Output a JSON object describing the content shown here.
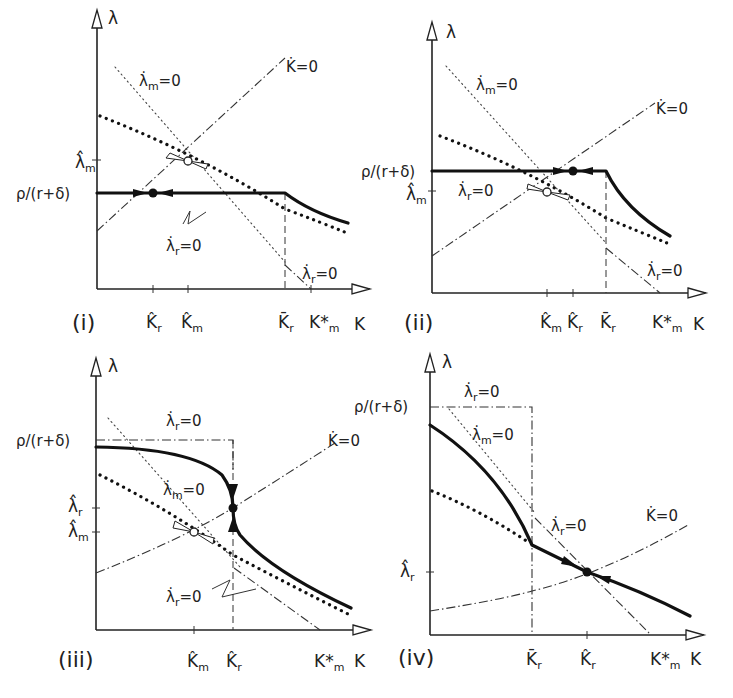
{
  "figure": {
    "panels": [
      {
        "id": "i",
        "label": "(i)",
        "y_axis": "λ",
        "x_axis": "K",
        "y_ticks": [
          {
            "label": "λ̂",
            "sub": "m"
          },
          {
            "label": "ρ/(r+δ)",
            "sub": ""
          }
        ],
        "x_ticks": [
          {
            "label": "K̂",
            "sub": "r"
          },
          {
            "label": "K̂",
            "sub": "m"
          },
          {
            "label": "K̄",
            "sub": "r"
          },
          {
            "label": "K*",
            "sub": "m"
          }
        ],
        "curve_labels": [
          {
            "text": "λ̇",
            "sub": "m",
            "suffix": "=0"
          },
          {
            "text": "K̇",
            "sub": "",
            "suffix": "=0"
          },
          {
            "text": "λ̇",
            "sub": "r",
            "suffix": "=0"
          },
          {
            "text": "λ̇",
            "sub": "r",
            "suffix": "=0"
          }
        ]
      },
      {
        "id": "ii",
        "label": "(ii)",
        "y_axis": "λ",
        "x_axis": "K",
        "y_ticks": [
          {
            "label": "ρ/(r+δ)",
            "sub": ""
          },
          {
            "label": "λ̂",
            "sub": "m"
          }
        ],
        "x_ticks": [
          {
            "label": "K̂",
            "sub": "m"
          },
          {
            "label": "K̂",
            "sub": "r"
          },
          {
            "label": "K̄",
            "sub": "r"
          },
          {
            "label": "K*",
            "sub": "m"
          }
        ],
        "curve_labels": [
          {
            "text": "λ̇",
            "sub": "m",
            "suffix": "=0"
          },
          {
            "text": "K̇",
            "sub": "",
            "suffix": "=0"
          },
          {
            "text": "λ̇",
            "sub": "r",
            "suffix": "=0"
          },
          {
            "text": "λ̇",
            "sub": "r",
            "suffix": "=0"
          }
        ]
      },
      {
        "id": "iii",
        "label": "(iii)",
        "y_axis": "λ",
        "x_axis": "K",
        "y_ticks": [
          {
            "label": "ρ/(r+δ)",
            "sub": ""
          },
          {
            "label": "λ̂",
            "sub": "r"
          },
          {
            "label": "λ̂",
            "sub": "m"
          }
        ],
        "x_ticks": [
          {
            "label": "K̂",
            "sub": "m"
          },
          {
            "label": "K̂",
            "sub": "r"
          },
          {
            "label": "K*",
            "sub": "m"
          }
        ],
        "curve_labels": [
          {
            "text": "λ̇",
            "sub": "r",
            "suffix": "=0"
          },
          {
            "text": "K̇",
            "sub": "",
            "suffix": "=0"
          },
          {
            "text": "λ̇",
            "sub": "m",
            "suffix": "=0"
          },
          {
            "text": "λ̇",
            "sub": "r",
            "suffix": "=0"
          }
        ]
      },
      {
        "id": "iv",
        "label": "(iv)",
        "y_axis": "λ",
        "x_axis": "K",
        "y_ticks": [
          {
            "label": "ρ/(r+δ)",
            "sub": ""
          },
          {
            "label": "λ̂",
            "sub": "r"
          }
        ],
        "x_ticks": [
          {
            "label": "K̄",
            "sub": "r"
          },
          {
            "label": "K̂",
            "sub": "r"
          },
          {
            "label": "K*",
            "sub": "m"
          }
        ],
        "curve_labels": [
          {
            "text": "λ̇",
            "sub": "r",
            "suffix": "=0"
          },
          {
            "text": "λ̇",
            "sub": "m",
            "suffix": "=0"
          },
          {
            "text": "λ̇",
            "sub": "r",
            "suffix": "=0"
          },
          {
            "text": "K̇",
            "sub": "",
            "suffix": "=0"
          }
        ]
      }
    ]
  }
}
